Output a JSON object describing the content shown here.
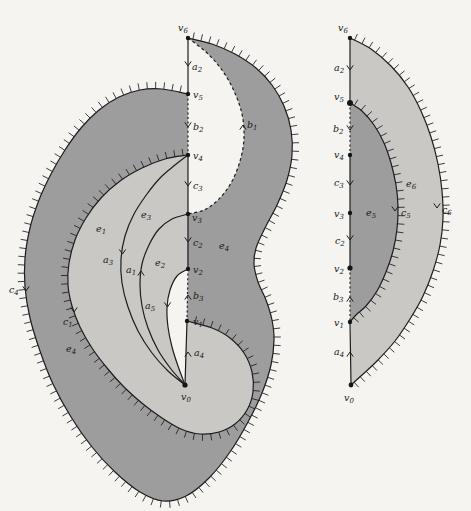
{
  "figure_type": "surface-diagram-with-labeled-arcs",
  "colors": {
    "background": "#f5f4f0",
    "region_dark": "#9d9d9d",
    "region_light": "#c9c8c5",
    "line": "#1d1d1d",
    "label": "#1a1a1a"
  },
  "left_figure": {
    "name": "large-surface-with-arc-system",
    "labels": [
      {
        "name": "v6",
        "main": "v",
        "sub": "6",
        "x": 178,
        "y": 31
      },
      {
        "name": "v5",
        "main": "v",
        "sub": "5",
        "x": 193,
        "y": 98
      },
      {
        "name": "v4",
        "main": "v",
        "sub": "4",
        "x": 193,
        "y": 159
      },
      {
        "name": "v3",
        "main": "v",
        "sub": "3",
        "x": 192,
        "y": 221
      },
      {
        "name": "v2",
        "main": "v",
        "sub": "2",
        "x": 193,
        "y": 273
      },
      {
        "name": "v1",
        "main": "v",
        "sub": "1",
        "x": 193,
        "y": 325
      },
      {
        "name": "v0",
        "main": "v",
        "sub": "0",
        "x": 181,
        "y": 400
      },
      {
        "name": "a2",
        "main": "a",
        "sub": "2",
        "x": 192,
        "y": 70
      },
      {
        "name": "b2",
        "main": "b",
        "sub": "2",
        "x": 193,
        "y": 130
      },
      {
        "name": "c3",
        "main": "c",
        "sub": "3",
        "x": 193,
        "y": 189
      },
      {
        "name": "c2",
        "main": "c",
        "sub": "2",
        "x": 193,
        "y": 246
      },
      {
        "name": "b3",
        "main": "b",
        "sub": "3",
        "x": 193,
        "y": 299
      },
      {
        "name": "a4",
        "main": "a",
        "sub": "4",
        "x": 194,
        "y": 356
      },
      {
        "name": "a3",
        "main": "a",
        "sub": "3",
        "x": 103,
        "y": 263
      },
      {
        "name": "a1",
        "main": "a",
        "sub": "1",
        "x": 126,
        "y": 273
      },
      {
        "name": "a5",
        "main": "a",
        "sub": "5",
        "x": 145,
        "y": 309
      },
      {
        "name": "b1",
        "main": "b",
        "sub": "1",
        "x": 247,
        "y": 128
      },
      {
        "name": "c1",
        "main": "c",
        "sub": "1",
        "x": 63,
        "y": 325
      },
      {
        "name": "c4",
        "main": "c",
        "sub": "4",
        "x": 9,
        "y": 293
      },
      {
        "name": "e1",
        "main": "e",
        "sub": "1",
        "x": 96,
        "y": 232
      },
      {
        "name": "e3",
        "main": "e",
        "sub": "3",
        "x": 141,
        "y": 218
      },
      {
        "name": "e2",
        "main": "e",
        "sub": "2",
        "x": 155,
        "y": 266
      },
      {
        "name": "e4-right",
        "main": "e",
        "sub": "4",
        "x": 219,
        "y": 249
      },
      {
        "name": "e4-left",
        "main": "e",
        "sub": "4",
        "x": 66,
        "y": 352
      }
    ]
  },
  "right_figure": {
    "name": "crescent-surface",
    "labels": [
      {
        "name": "v6",
        "main": "v",
        "sub": "6",
        "x": 338,
        "y": 31
      },
      {
        "name": "v5",
        "main": "v",
        "sub": "5",
        "x": 334,
        "y": 100
      },
      {
        "name": "v4",
        "main": "v",
        "sub": "4",
        "x": 334,
        "y": 158
      },
      {
        "name": "v3",
        "main": "v",
        "sub": "3",
        "x": 334,
        "y": 217
      },
      {
        "name": "v2",
        "main": "v",
        "sub": "2",
        "x": 334,
        "y": 272
      },
      {
        "name": "v1",
        "main": "v",
        "sub": "1",
        "x": 334,
        "y": 326
      },
      {
        "name": "v0",
        "main": "v",
        "sub": "0",
        "x": 344,
        "y": 401
      },
      {
        "name": "a2",
        "main": "a",
        "sub": "2",
        "x": 334,
        "y": 71
      },
      {
        "name": "b2",
        "main": "b",
        "sub": "2",
        "x": 333,
        "y": 132
      },
      {
        "name": "c3",
        "main": "c",
        "sub": "3",
        "x": 334,
        "y": 186
      },
      {
        "name": "c2",
        "main": "c",
        "sub": "2",
        "x": 335,
        "y": 244
      },
      {
        "name": "b3",
        "main": "b",
        "sub": "3",
        "x": 333,
        "y": 300
      },
      {
        "name": "a4",
        "main": "a",
        "sub": "4",
        "x": 334,
        "y": 355
      },
      {
        "name": "e5",
        "main": "e",
        "sub": "5",
        "x": 366,
        "y": 216
      },
      {
        "name": "c5",
        "main": "c",
        "sub": "5",
        "x": 401,
        "y": 216
      },
      {
        "name": "e6",
        "main": "e",
        "sub": "6",
        "x": 406,
        "y": 187
      },
      {
        "name": "c6",
        "main": "c",
        "sub": "6",
        "x": 442,
        "y": 213
      }
    ]
  }
}
